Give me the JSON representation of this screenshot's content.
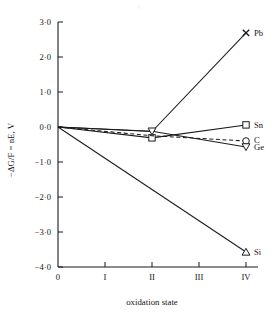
{
  "figure": {
    "background": "#ffffff",
    "ink_color": "#1b1b1b",
    "top_artifact": "|"
  },
  "chart_data": {
    "type": "line",
    "title": "",
    "xlabel": "oxidation state",
    "ylabel": "−ΔG/F = nE, V",
    "x": [
      0,
      1,
      2,
      3,
      4
    ],
    "categories": [
      "0",
      "I",
      "II",
      "III",
      "IV"
    ],
    "xlim": [
      0,
      4
    ],
    "ylim": [
      -4.0,
      3.0
    ],
    "ytick_values": [
      3.0,
      2.0,
      1.0,
      0.0,
      -1.0,
      -2.0,
      -3.0,
      -4.0
    ],
    "ytick_labels": [
      "3·0",
      "2·0",
      "1·0",
      "0·0",
      "−1·0",
      "−2·0",
      "−3·0",
      "−4·0"
    ],
    "xtick_labels": [
      "0",
      "I",
      "II",
      "III",
      "IV"
    ],
    "grid": false,
    "legend": "inline-right-end-labels",
    "series": [
      {
        "name": "Pb",
        "label": "Pb",
        "marker": "cross-x",
        "linestyle": "solid",
        "color": "#1b1b1b",
        "points": [
          {
            "x": 0,
            "y": 0.0
          },
          {
            "x": 2,
            "y": -0.13
          },
          {
            "x": 4,
            "y": 2.69
          }
        ],
        "marker_points": [
          {
            "x": 4,
            "y": 2.69
          }
        ]
      },
      {
        "name": "Sn",
        "label": "Sn",
        "marker": "square",
        "linestyle": "solid",
        "color": "#1b1b1b",
        "points": [
          {
            "x": 0,
            "y": 0.0
          },
          {
            "x": 2,
            "y": -0.31
          },
          {
            "x": 4,
            "y": 0.06
          }
        ],
        "marker_points": [
          {
            "x": 2,
            "y": -0.31
          },
          {
            "x": 4,
            "y": 0.06
          }
        ]
      },
      {
        "name": "C",
        "label": "C",
        "marker": "circle",
        "linestyle": "dashed",
        "color": "#1b1b1b",
        "points": [
          {
            "x": 0,
            "y": 0.0
          },
          {
            "x": 2,
            "y": -0.25
          },
          {
            "x": 4,
            "y": -0.4
          }
        ],
        "marker_points": [
          {
            "x": 4,
            "y": -0.4
          }
        ]
      },
      {
        "name": "Ge",
        "label": "Ge",
        "marker": "triangle-down",
        "linestyle": "solid",
        "color": "#1b1b1b",
        "points": [
          {
            "x": 0,
            "y": 0.0
          },
          {
            "x": 2,
            "y": -0.12
          },
          {
            "x": 4,
            "y": -0.57
          }
        ],
        "marker_points": [
          {
            "x": 2,
            "y": -0.12
          },
          {
            "x": 4,
            "y": -0.57
          }
        ]
      },
      {
        "name": "Si",
        "label": "Si",
        "marker": "triangle-up",
        "linestyle": "solid",
        "color": "#1b1b1b",
        "points": [
          {
            "x": 0,
            "y": 0.0
          },
          {
            "x": 4,
            "y": -3.57
          }
        ],
        "marker_points": [
          {
            "x": 4,
            "y": -3.57
          }
        ]
      }
    ]
  }
}
